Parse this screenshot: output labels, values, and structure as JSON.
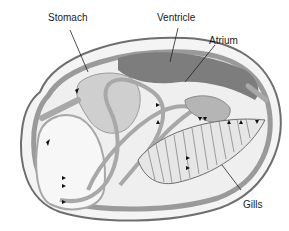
{
  "labels": {
    "stomach": "Stomach",
    "ventricle": "Ventricle",
    "atrium": "Atrium",
    "gills": "Gills"
  },
  "colors": {
    "shell_outline": "#7a7a7a",
    "mantle": "#9a9a9a",
    "heart_dark": "#7d7d7d",
    "organ_light": "#cfcfcf",
    "vessel": "#a8a8a8",
    "body_fill": "#efefef",
    "arrow": "#111111",
    "label_text": "#1a1a1a"
  }
}
